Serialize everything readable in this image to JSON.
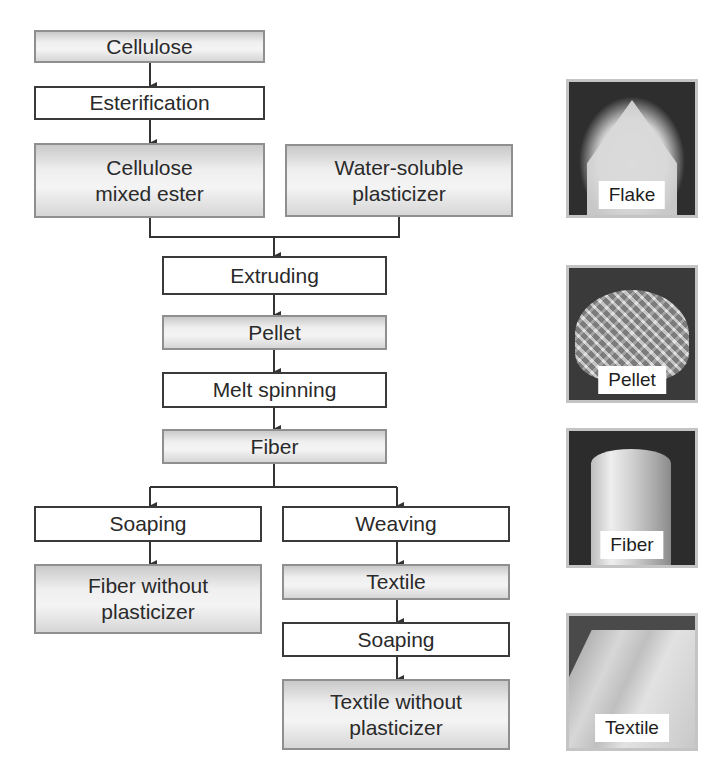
{
  "diagram": {
    "type": "process-flowchart",
    "nodes": [
      {
        "id": "cellulose",
        "label": "Cellulose",
        "kind": "product"
      },
      {
        "id": "esterification",
        "label": "Esterification",
        "kind": "process"
      },
      {
        "id": "cellulose_mixed_ester",
        "label": "Cellulose\nmixed ester",
        "kind": "product"
      },
      {
        "id": "water_soluble_plasticizer",
        "label": "Water-soluble\nplasticizer",
        "kind": "product"
      },
      {
        "id": "extruding",
        "label": "Extruding",
        "kind": "process"
      },
      {
        "id": "pellet",
        "label": "Pellet",
        "kind": "product"
      },
      {
        "id": "melt_spinning",
        "label": "Melt spinning",
        "kind": "process"
      },
      {
        "id": "fiber",
        "label": "Fiber",
        "kind": "product"
      },
      {
        "id": "soaping_left",
        "label": "Soaping",
        "kind": "process"
      },
      {
        "id": "fiber_without_plasticizer",
        "label": "Fiber without\nplasticizer",
        "kind": "product"
      },
      {
        "id": "weaving",
        "label": "Weaving",
        "kind": "process"
      },
      {
        "id": "textile",
        "label": "Textile",
        "kind": "product"
      },
      {
        "id": "soaping_right",
        "label": "Soaping",
        "kind": "process"
      },
      {
        "id": "textile_without_plasticizer",
        "label": "Textile without\nplasticizer",
        "kind": "product"
      }
    ],
    "edges": [
      [
        "cellulose",
        "esterification"
      ],
      [
        "esterification",
        "cellulose_mixed_ester"
      ],
      [
        "cellulose_mixed_ester",
        "extruding"
      ],
      [
        "water_soluble_plasticizer",
        "extruding"
      ],
      [
        "extruding",
        "pellet"
      ],
      [
        "pellet",
        "melt_spinning"
      ],
      [
        "melt_spinning",
        "fiber"
      ],
      [
        "fiber",
        "soaping_left"
      ],
      [
        "fiber",
        "weaving"
      ],
      [
        "soaping_left",
        "fiber_without_plasticizer"
      ],
      [
        "weaving",
        "textile"
      ],
      [
        "textile",
        "soaping_right"
      ],
      [
        "soaping_right",
        "textile_without_plasticizer"
      ]
    ]
  },
  "photos": [
    {
      "id": "flake",
      "label": "Flake"
    },
    {
      "id": "pellet",
      "label": "Pellet"
    },
    {
      "id": "fiber",
      "label": "Fiber"
    },
    {
      "id": "textile",
      "label": "Textile"
    }
  ],
  "colors": {
    "process_border": "#3a3a3a",
    "product_border": "#8f8f8f",
    "product_fill": "#e8e8e8",
    "connector": "#333333"
  }
}
